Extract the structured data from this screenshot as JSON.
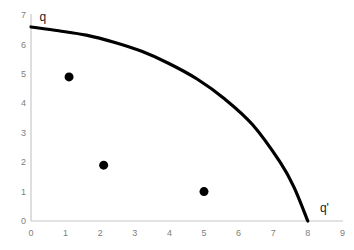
{
  "chart_data": {
    "type": "line",
    "title": "",
    "subtitle": "",
    "xlabel": "",
    "ylabel": "",
    "xlim": [
      0,
      9
    ],
    "ylim": [
      0,
      7
    ],
    "grid": false,
    "legend": null,
    "x_ticks": [
      "0",
      "1",
      "2",
      "3",
      "4",
      "5",
      "6",
      "7",
      "8",
      "9"
    ],
    "y_ticks": [
      "0",
      "1",
      "2",
      "3",
      "4",
      "5",
      "6",
      "7"
    ],
    "series": [
      {
        "name": "frontier-curve",
        "type": "line",
        "color": "#000000",
        "linewidth": 3,
        "x": [
          0,
          0.8,
          1.6,
          2.4,
          3.2,
          4.0,
          4.8,
          5.6,
          6.4,
          7.2,
          7.6,
          8.0
        ],
        "y": [
          6.6,
          6.47,
          6.32,
          6.08,
          5.77,
          5.35,
          4.83,
          4.15,
          3.28,
          2.0,
          1.15,
          0.0
        ]
      },
      {
        "name": "points",
        "type": "scatter",
        "color": "#000000",
        "marker": "circle",
        "markersize": 9,
        "points": [
          {
            "x": 1.1,
            "y": 4.9
          },
          {
            "x": 2.1,
            "y": 1.9
          },
          {
            "x": 5.0,
            "y": 1.0
          }
        ]
      }
    ],
    "annotations": [
      {
        "name": "curve-start-label",
        "text": "q",
        "x": 0.25,
        "y": 6.95
      },
      {
        "name": "curve-end-label",
        "text": "q'",
        "x": 8.35,
        "y": 0.45
      }
    ],
    "colors": {
      "axis": "#c8c8c8",
      "tick_text": "#808080",
      "curve": "#000000",
      "marker": "#000000",
      "annotation": "#1a1a1a",
      "background": "#ffffff"
    }
  },
  "geometry": {
    "origin_x_px": 31,
    "origin_y_px": 221,
    "x_unit_px": 34.6,
    "y_unit_px": 29.4
  }
}
